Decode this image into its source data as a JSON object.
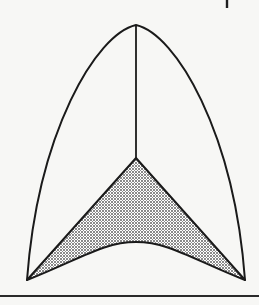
{
  "figure": {
    "title": "Parabolic arch with shaded curvilinear triangle",
    "background_color": "#f7f7f5",
    "ink_color": "#1a1a1a",
    "fill_color": "#999999",
    "fill_pattern": "halftone-dither",
    "canvas": {
      "width": 259,
      "height": 305
    }
  },
  "geometry": {
    "apex": {
      "x": 136,
      "y": 25
    },
    "left_base_vertex": {
      "x": 27,
      "y": 280
    },
    "right_base_vertex": {
      "x": 245,
      "y": 280
    },
    "centerline": {
      "x": 136,
      "y_top": 25,
      "y_bottom": 158
    },
    "shaded_apex": {
      "x": 136,
      "y": 158
    },
    "base_arc_crest": {
      "x": 136,
      "y": 242
    },
    "outer_arc_left_control": {
      "x": 38,
      "y": 92
    },
    "outer_arc_right_control": {
      "x": 234,
      "y": 92
    },
    "base_arc_left_control": {
      "x": 82,
      "y": 258
    },
    "base_arc_right_control": {
      "x": 190,
      "y": 258
    },
    "stroke_width_outline": 2.0,
    "stroke_width_centerline": 1.8
  },
  "elements": {
    "outer_arch_name": "outer parabolic arch",
    "centerline_name": "vertical centerline",
    "shaded_region_name": "shaded curvilinear triangle",
    "base_arc_name": "concave base arc",
    "bottom_rule_name": "bottom horizontal rule",
    "tick_mark_name": "top-right tick mark"
  },
  "bottom_rule": {
    "x_start": 0,
    "x_end": 259,
    "y": 296,
    "thickness": 2.2,
    "color": "#2a2a2a"
  },
  "tick_mark": {
    "x": 227,
    "y_top": 0,
    "y_bottom": 8,
    "thickness": 2.4,
    "color": "#1f1f1f"
  },
  "labels": {
    "figure_caption": "",
    "axis_text": "",
    "annotations": []
  }
}
